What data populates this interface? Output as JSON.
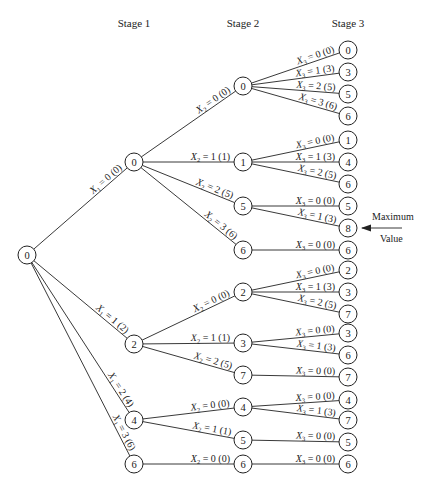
{
  "headers": {
    "stage1": "Stage 1",
    "stage2": "Stage 2",
    "stage3": "Stage 3"
  },
  "annotation": {
    "line1": "Maximum",
    "line2": "Value",
    "target_node": "s3_8"
  },
  "nodes": [
    {
      "id": "root",
      "label": "0",
      "x": 27,
      "y": 255
    },
    {
      "id": "s1_0",
      "label": "0",
      "x": 134,
      "y": 162
    },
    {
      "id": "s1_2",
      "label": "2",
      "x": 134,
      "y": 344
    },
    {
      "id": "s1_4",
      "label": "4",
      "x": 134,
      "y": 420
    },
    {
      "id": "s1_6",
      "label": "6",
      "x": 134,
      "y": 464
    },
    {
      "id": "s2_a0",
      "label": "0",
      "x": 243,
      "y": 86
    },
    {
      "id": "s2_a1",
      "label": "1",
      "x": 243,
      "y": 162
    },
    {
      "id": "s2_a5",
      "label": "5",
      "x": 243,
      "y": 206
    },
    {
      "id": "s2_a6",
      "label": "6",
      "x": 243,
      "y": 250
    },
    {
      "id": "s2_b2",
      "label": "2",
      "x": 243,
      "y": 292
    },
    {
      "id": "s2_b3",
      "label": "3",
      "x": 243,
      "y": 343
    },
    {
      "id": "s2_b7",
      "label": "7",
      "x": 243,
      "y": 375
    },
    {
      "id": "s2_c4",
      "label": "4",
      "x": 243,
      "y": 407
    },
    {
      "id": "s2_c5",
      "label": "5",
      "x": 243,
      "y": 440
    },
    {
      "id": "s2_d6",
      "label": "6",
      "x": 243,
      "y": 464
    },
    {
      "id": "s3_1",
      "label": "0",
      "x": 348,
      "y": 50
    },
    {
      "id": "s3_2",
      "label": "3",
      "x": 348,
      "y": 72
    },
    {
      "id": "s3_3",
      "label": "5",
      "x": 348,
      "y": 94
    },
    {
      "id": "s3_4",
      "label": "6",
      "x": 348,
      "y": 116
    },
    {
      "id": "s3_5",
      "label": "1",
      "x": 348,
      "y": 140
    },
    {
      "id": "s3_6",
      "label": "4",
      "x": 348,
      "y": 162
    },
    {
      "id": "s3_7",
      "label": "6",
      "x": 348,
      "y": 184
    },
    {
      "id": "s3_8a",
      "label": "5",
      "x": 348,
      "y": 206
    },
    {
      "id": "s3_8",
      "label": "8",
      "x": 348,
      "y": 228
    },
    {
      "id": "s3_10",
      "label": "6",
      "x": 348,
      "y": 250
    },
    {
      "id": "s3_11",
      "label": "2",
      "x": 348,
      "y": 270
    },
    {
      "id": "s3_12",
      "label": "3",
      "x": 348,
      "y": 292
    },
    {
      "id": "s3_13",
      "label": "7",
      "x": 348,
      "y": 314
    },
    {
      "id": "s3_14",
      "label": "3",
      "x": 348,
      "y": 333
    },
    {
      "id": "s3_15",
      "label": "6",
      "x": 348,
      "y": 355
    },
    {
      "id": "s3_16",
      "label": "7",
      "x": 348,
      "y": 377
    },
    {
      "id": "s3_17",
      "label": "4",
      "x": 348,
      "y": 400
    },
    {
      "id": "s3_18",
      "label": "7",
      "x": 348,
      "y": 420
    },
    {
      "id": "s3_19",
      "label": "5",
      "x": 348,
      "y": 442
    },
    {
      "id": "s3_20",
      "label": "6",
      "x": 348,
      "y": 464
    }
  ],
  "edges": [
    {
      "from": "root",
      "to": "s1_0",
      "var": "X",
      "sub": "1",
      "text": " = 0 (0)"
    },
    {
      "from": "root",
      "to": "s1_2",
      "var": "X",
      "sub": "1",
      "text": " = 1 (2)"
    },
    {
      "from": "root",
      "to": "s1_4",
      "var": "X",
      "sub": "1",
      "text": " = 2 (4)"
    },
    {
      "from": "root",
      "to": "s1_6",
      "var": "X",
      "sub": "1",
      "text": " = 3 (6)"
    },
    {
      "from": "s1_0",
      "to": "s2_a0",
      "var": "X",
      "sub": "2",
      "text": " = 0 (0)"
    },
    {
      "from": "s1_0",
      "to": "s2_a1",
      "var": "X",
      "sub": "2",
      "text": " = 1 (1)"
    },
    {
      "from": "s1_0",
      "to": "s2_a5",
      "var": "X",
      "sub": "2",
      "text": " = 2 (5)"
    },
    {
      "from": "s1_0",
      "to": "s2_a6",
      "var": "X",
      "sub": "2",
      "text": " = 3 (6)"
    },
    {
      "from": "s1_2",
      "to": "s2_b2",
      "var": "X",
      "sub": "2",
      "text": " = 0 (0)"
    },
    {
      "from": "s1_2",
      "to": "s2_b3",
      "var": "X",
      "sub": "2",
      "text": " = 1 (1)"
    },
    {
      "from": "s1_2",
      "to": "s2_b7",
      "var": "X",
      "sub": "2",
      "text": " = 2 (5)"
    },
    {
      "from": "s1_4",
      "to": "s2_c4",
      "var": "X",
      "sub": "2",
      "text": " = 0 (0)"
    },
    {
      "from": "s1_4",
      "to": "s2_c5",
      "var": "X",
      "sub": "2",
      "text": " = 1 (1)"
    },
    {
      "from": "s1_6",
      "to": "s2_d6",
      "var": "X",
      "sub": "2",
      "text": " = 0 (0)"
    },
    {
      "from": "s2_a0",
      "to": "s3_1",
      "var": "X",
      "sub": "3",
      "text": " = 0 (0)"
    },
    {
      "from": "s2_a0",
      "to": "s3_2",
      "var": "X",
      "sub": "3",
      "text": " = 1 (3)"
    },
    {
      "from": "s2_a0",
      "to": "s3_3",
      "var": "X",
      "sub": "3",
      "text": " = 2 (5)"
    },
    {
      "from": "s2_a0",
      "to": "s3_4",
      "var": "X",
      "sub": "3",
      "text": " = 3 (6)"
    },
    {
      "from": "s2_a1",
      "to": "s3_5",
      "var": "X",
      "sub": "3",
      "text": " = 0 (0)"
    },
    {
      "from": "s2_a1",
      "to": "s3_6",
      "var": "X",
      "sub": "3",
      "text": " = 1 (3)"
    },
    {
      "from": "s2_a1",
      "to": "s3_7",
      "var": "X",
      "sub": "3",
      "text": " = 2 (5)"
    },
    {
      "from": "s2_a5",
      "to": "s3_8a",
      "var": "X",
      "sub": "3",
      "text": " = 0 (0)"
    },
    {
      "from": "s2_a5",
      "to": "s3_8",
      "var": "X",
      "sub": "3",
      "text": " = 1 (3)"
    },
    {
      "from": "s2_a6",
      "to": "s3_10",
      "var": "X",
      "sub": "3",
      "text": " = 0 (0)"
    },
    {
      "from": "s2_b2",
      "to": "s3_11",
      "var": "X",
      "sub": "3",
      "text": " = 0 (0)"
    },
    {
      "from": "s2_b2",
      "to": "s3_12",
      "var": "X",
      "sub": "3",
      "text": " = 1 (3)"
    },
    {
      "from": "s2_b2",
      "to": "s3_13",
      "var": "X",
      "sub": "3",
      "text": " = 2 (5)"
    },
    {
      "from": "s2_b3",
      "to": "s3_14",
      "var": "X",
      "sub": "3",
      "text": " = 0 (0)"
    },
    {
      "from": "s2_b3",
      "to": "s3_15",
      "var": "X",
      "sub": "3",
      "text": " = 1 (3)"
    },
    {
      "from": "s2_b7",
      "to": "s3_16",
      "var": "X",
      "sub": "3",
      "text": " = 0 (0)"
    },
    {
      "from": "s2_c4",
      "to": "s3_17",
      "var": "X",
      "sub": "3",
      "text": " = 0 (0)"
    },
    {
      "from": "s2_c4",
      "to": "s3_18",
      "var": "X",
      "sub": "3",
      "text": " = 1 (3)"
    },
    {
      "from": "s2_c5",
      "to": "s3_19",
      "var": "X",
      "sub": "3",
      "text": " = 0 (0)"
    },
    {
      "from": "s2_d6",
      "to": "s3_20",
      "var": "X",
      "sub": "3",
      "text": " = 0 (0)"
    }
  ]
}
